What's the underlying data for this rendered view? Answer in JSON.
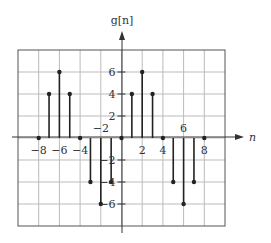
{
  "chart_data": {
    "type": "stem",
    "title": "",
    "ylabel": "g[n]",
    "xlabel": "n",
    "x": [
      -8,
      -7,
      -6,
      -5,
      -4,
      -3,
      -2,
      -1,
      0,
      1,
      2,
      3,
      4,
      5,
      6,
      7,
      8
    ],
    "values": [
      0,
      4,
      6,
      4,
      0,
      -4,
      -6,
      -4,
      0,
      4,
      6,
      4,
      0,
      -4,
      -6,
      -4,
      0
    ],
    "xlim": [
      -10,
      10
    ],
    "ylim": [
      -8,
      8
    ],
    "grid": true,
    "x_tick_labels": [
      {
        "value": -8,
        "label": "−8",
        "pos": "below"
      },
      {
        "value": -6,
        "label": "−6",
        "pos": "below"
      },
      {
        "value": -4,
        "label": "−4",
        "pos": "below"
      },
      {
        "value": -2,
        "label": "−2",
        "pos": "above"
      },
      {
        "value": 2,
        "label": "2",
        "pos": "below"
      },
      {
        "value": 4,
        "label": "4",
        "pos": "below"
      },
      {
        "value": 6,
        "label": "6",
        "pos": "above"
      },
      {
        "value": 8,
        "label": "8",
        "pos": "below"
      }
    ],
    "y_tick_labels": [
      {
        "value": 6,
        "label": "6"
      },
      {
        "value": 4,
        "label": "4"
      },
      {
        "value": 2,
        "label": "2"
      },
      {
        "value": -2,
        "label": "−2"
      },
      {
        "value": -4,
        "label": "−4"
      },
      {
        "value": -6,
        "label": "−6"
      }
    ]
  },
  "colors": {
    "frame": "#555555",
    "grid": "#bbbbbb",
    "stem": "#222222",
    "axis": "#333333",
    "text": "#333333"
  }
}
